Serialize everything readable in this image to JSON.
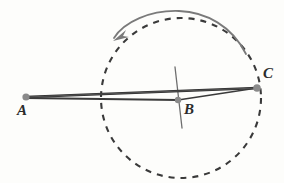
{
  "figure": {
    "background_color": "#fdfdfb",
    "width": 284,
    "height": 183
  },
  "points": [
    {
      "id": "A",
      "label": "A",
      "x": 26,
      "y": 97,
      "label_x": 17,
      "label_y": 103,
      "dot_color": "#8a8a8a",
      "dot_radius": 3.6
    },
    {
      "id": "B",
      "label": "B",
      "x": 178,
      "y": 100,
      "label_x": 184,
      "label_y": 102,
      "dot_color": "#8a8a8a",
      "dot_radius": 3.2
    },
    {
      "id": "C",
      "label": "C",
      "x": 257,
      "y": 88,
      "label_x": 263,
      "label_y": 66,
      "dot_color": "#8a8a8a",
      "dot_radius": 3.8
    }
  ],
  "circle": {
    "name": "dashed-rotation-circle",
    "center_x": 181,
    "center_y": 98,
    "radius": 80,
    "stroke_color": "#3a3a3a",
    "stroke_width": 2.1,
    "dash_pattern": "6 6"
  },
  "segments": [
    {
      "name": "segment-a-to-c-lower",
      "x1": 26,
      "y1": 97,
      "x2": 257,
      "y2": 88,
      "stroke_color": "#2f2f2f",
      "stroke_width": 2.4
    },
    {
      "name": "segment-a-to-c-upper",
      "x1": 26,
      "y1": 97,
      "x2": 257,
      "y2": 88,
      "stroke_color": "#555555",
      "stroke_width": 1.2
    },
    {
      "name": "segment-a-through-b",
      "x1": 26,
      "y1": 98,
      "x2": 178,
      "y2": 100,
      "stroke_color": "#3a3a3a",
      "stroke_width": 1.8
    },
    {
      "name": "segment-b-to-c",
      "x1": 178,
      "y1": 100,
      "x2": 257,
      "y2": 88,
      "stroke_color": "#3a3a3a",
      "stroke_width": 1.6
    }
  ],
  "crosshair": {
    "name": "b-vertical-tick",
    "x1": 175,
    "y1": 67,
    "x2": 182,
    "y2": 128,
    "stroke_color": "#6e6e6e",
    "stroke_width": 1.3
  },
  "rotation_arrow": {
    "name": "counterclockwise-rotation-arrow",
    "path": "M 246 54 C 232 26 206 12 179 11 C 150 10 124 22 114 38",
    "stroke_color": "#7a7a7a",
    "stroke_width": 1.8,
    "arrowhead_points": "113,41 126,30 123,36 129,37",
    "direction": "counterclockwise"
  },
  "geometry_notes": {
    "rotation_center": "B",
    "rotating_segment": "A to C"
  }
}
